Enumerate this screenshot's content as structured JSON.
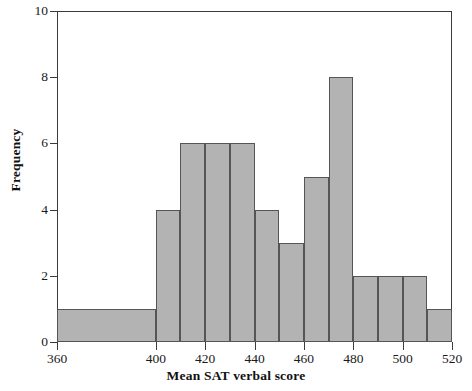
{
  "chart_data": {
    "type": "bar",
    "title": "",
    "xlabel": "Mean SAT verbal score",
    "ylabel": "Frequency",
    "grid": false,
    "legend": "none",
    "xlim": [
      360,
      520
    ],
    "ylim": [
      0,
      10
    ],
    "x_ticks": [
      360,
      400,
      420,
      440,
      460,
      480,
      500,
      520
    ],
    "y_ticks": [
      0,
      2,
      4,
      6,
      8,
      10
    ],
    "bin_edges": [
      360,
      400,
      410,
      420,
      430,
      440,
      450,
      460,
      470,
      480,
      490,
      500,
      510,
      520
    ],
    "categories": [
      "360-400",
      "400-410",
      "410-420",
      "420-430",
      "430-440",
      "440-450",
      "450-460",
      "460-470",
      "470-480",
      "480-490",
      "490-500",
      "500-510",
      "510-520"
    ],
    "values": [
      1,
      4,
      6,
      6,
      6,
      4,
      3,
      5,
      8,
      2,
      2,
      2,
      1
    ],
    "bar_color": "#b3b3b3",
    "bar_edge_color": "#555555",
    "axis_color": "#3b3b3b"
  },
  "axis": {
    "x_tick_labels": [
      "360",
      "400",
      "420",
      "440",
      "460",
      "480",
      "500",
      "520"
    ],
    "y_tick_labels": [
      "0",
      "2",
      "4",
      "6",
      "8",
      "10"
    ]
  }
}
